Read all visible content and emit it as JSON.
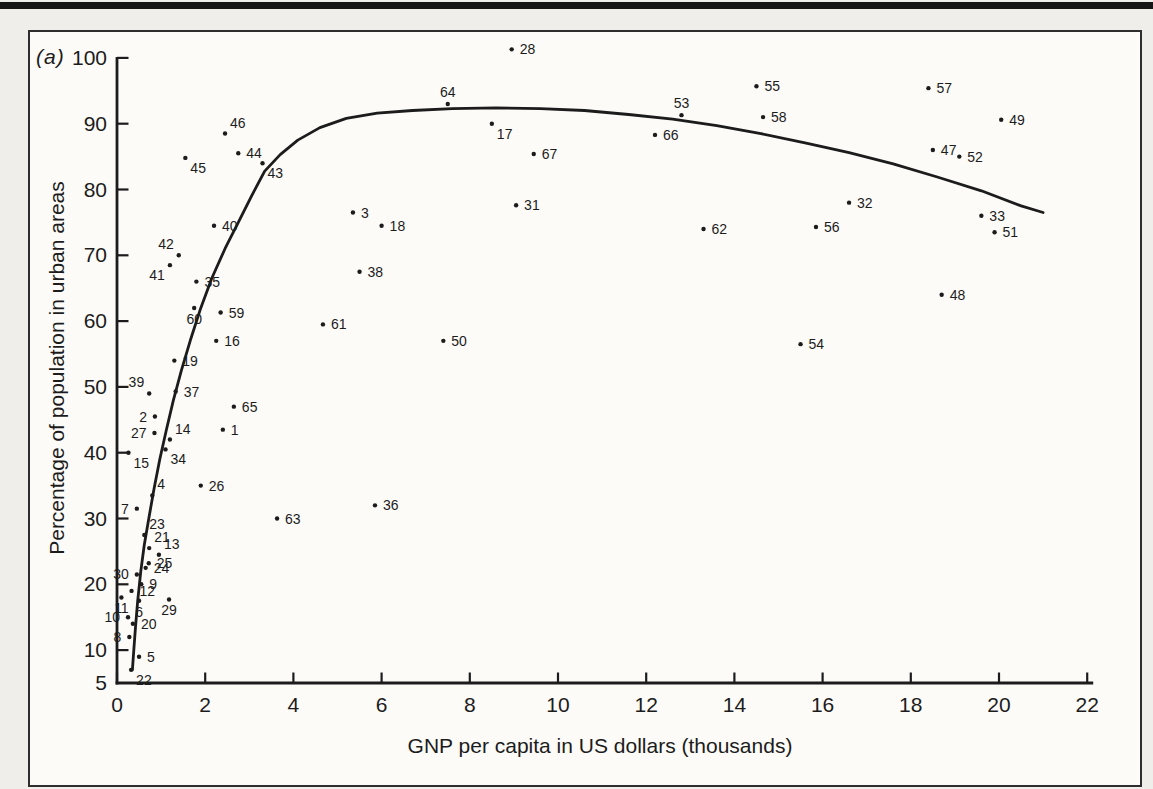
{
  "page": {
    "background_color": "#efeeea",
    "top_rule_color": "#161616"
  },
  "figure": {
    "panel_label": "(a)",
    "border_color": "#2e2e2e",
    "paper_color": "#fcfbf8",
    "ink_color": "#1c1c1c"
  },
  "chart_data": {
    "type": "scatter",
    "title": "",
    "xlabel": "GNP per capita in US dollars (thousands)",
    "ylabel": "Percentage of population in urban areas",
    "xlim": [
      0,
      22
    ],
    "ylim": [
      5,
      100
    ],
    "grid": false,
    "legend": "none",
    "x_ticks": [
      0,
      2,
      4,
      6,
      8,
      10,
      12,
      14,
      16,
      18,
      20,
      22
    ],
    "y_ticks": [
      100,
      90,
      80,
      70,
      60,
      50,
      40,
      30,
      20,
      10
    ],
    "y_axis_end_label": "5",
    "marker": "dot",
    "points": [
      {
        "id": 1,
        "x": 2.4,
        "y": 43.5,
        "label_side": "right"
      },
      {
        "id": 2,
        "x": 0.86,
        "y": 45.5,
        "label_side": "left"
      },
      {
        "id": 3,
        "x": 5.35,
        "y": 76.5,
        "label_side": "right"
      },
      {
        "id": 4,
        "x": 0.8,
        "y": 33.5,
        "label_side": "above-right"
      },
      {
        "id": 5,
        "x": 0.5,
        "y": 9,
        "label_side": "right"
      },
      {
        "id": 6,
        "x": 0.5,
        "y": 17.5,
        "label_side": "below"
      },
      {
        "id": 7,
        "x": 0.45,
        "y": 31.5,
        "label_side": "left"
      },
      {
        "id": 8,
        "x": 0.28,
        "y": 12,
        "label_side": "left"
      },
      {
        "id": 9,
        "x": 0.55,
        "y": 20,
        "label_side": "right"
      },
      {
        "id": 10,
        "x": 0.25,
        "y": 15,
        "label_side": "left"
      },
      {
        "id": 11,
        "x": 0.1,
        "y": 18,
        "label_side": "below"
      },
      {
        "id": 12,
        "x": 0.33,
        "y": 19,
        "label_side": "right"
      },
      {
        "id": 13,
        "x": 0.95,
        "y": 24.5,
        "label_side": "above-right"
      },
      {
        "id": 14,
        "x": 1.2,
        "y": 42,
        "label_side": "above-right"
      },
      {
        "id": 15,
        "x": 0.26,
        "y": 40,
        "label_side": "below-right"
      },
      {
        "id": 16,
        "x": 2.25,
        "y": 57,
        "label_side": "right"
      },
      {
        "id": 17,
        "x": 8.5,
        "y": 90,
        "label_side": "below-right"
      },
      {
        "id": 18,
        "x": 6.0,
        "y": 74.5,
        "label_side": "right"
      },
      {
        "id": 19,
        "x": 1.3,
        "y": 54,
        "label_side": "right"
      },
      {
        "id": 20,
        "x": 0.36,
        "y": 14,
        "label_side": "right"
      },
      {
        "id": 21,
        "x": 0.73,
        "y": 25.5,
        "label_side": "above-right"
      },
      {
        "id": 22,
        "x": 0.32,
        "y": 7,
        "label_side": "below-right"
      },
      {
        "id": 23,
        "x": 0.62,
        "y": 27.5,
        "label_side": "above-right"
      },
      {
        "id": 24,
        "x": 0.65,
        "y": 22.5,
        "label_side": "right"
      },
      {
        "id": 25,
        "x": 0.72,
        "y": 23.2,
        "label_side": "right"
      },
      {
        "id": 26,
        "x": 1.9,
        "y": 35,
        "label_side": "right"
      },
      {
        "id": 27,
        "x": 0.85,
        "y": 43,
        "label_side": "left"
      },
      {
        "id": 28,
        "x": 8.95,
        "y": 101.3,
        "label_side": "right"
      },
      {
        "id": 29,
        "x": 1.18,
        "y": 17.7,
        "label_side": "below"
      },
      {
        "id": 30,
        "x": 0.45,
        "y": 21.5,
        "label_side": "left"
      },
      {
        "id": 31,
        "x": 9.05,
        "y": 77.6,
        "label_side": "right"
      },
      {
        "id": 32,
        "x": 16.6,
        "y": 78,
        "label_side": "right"
      },
      {
        "id": 33,
        "x": 19.6,
        "y": 76,
        "label_side": "right"
      },
      {
        "id": 34,
        "x": 1.1,
        "y": 40.5,
        "label_side": "below-right"
      },
      {
        "id": 35,
        "x": 1.8,
        "y": 66,
        "label_side": "right"
      },
      {
        "id": 36,
        "x": 5.85,
        "y": 32,
        "label_side": "right"
      },
      {
        "id": 37,
        "x": 1.33,
        "y": 49.3,
        "label_side": "right"
      },
      {
        "id": 38,
        "x": 5.5,
        "y": 67.5,
        "label_side": "right"
      },
      {
        "id": 39,
        "x": 0.73,
        "y": 49,
        "label_side": "above-left"
      },
      {
        "id": 40,
        "x": 2.2,
        "y": 74.5,
        "label_side": "right"
      },
      {
        "id": 41,
        "x": 1.2,
        "y": 68.5,
        "label_side": "below-left"
      },
      {
        "id": 42,
        "x": 1.4,
        "y": 70,
        "label_side": "above-left"
      },
      {
        "id": 43,
        "x": 3.3,
        "y": 84,
        "label_side": "below-right"
      },
      {
        "id": 44,
        "x": 2.75,
        "y": 85.5,
        "label_side": "right"
      },
      {
        "id": 45,
        "x": 1.55,
        "y": 84.8,
        "label_side": "below-right"
      },
      {
        "id": 46,
        "x": 2.45,
        "y": 88.5,
        "label_side": "above-right"
      },
      {
        "id": 47,
        "x": 18.5,
        "y": 86,
        "label_side": "right"
      },
      {
        "id": 48,
        "x": 18.7,
        "y": 64,
        "label_side": "right"
      },
      {
        "id": 49,
        "x": 20.05,
        "y": 90.6,
        "label_side": "right"
      },
      {
        "id": 50,
        "x": 7.4,
        "y": 57,
        "label_side": "right"
      },
      {
        "id": 51,
        "x": 19.9,
        "y": 73.5,
        "label_side": "right"
      },
      {
        "id": 52,
        "x": 19.1,
        "y": 85,
        "label_side": "right"
      },
      {
        "id": 53,
        "x": 12.8,
        "y": 91.3,
        "label_side": "above"
      },
      {
        "id": 54,
        "x": 15.5,
        "y": 56.5,
        "label_side": "right"
      },
      {
        "id": 55,
        "x": 14.5,
        "y": 95.7,
        "label_side": "right"
      },
      {
        "id": 56,
        "x": 15.85,
        "y": 74.3,
        "label_side": "right"
      },
      {
        "id": 57,
        "x": 18.4,
        "y": 95.4,
        "label_side": "right"
      },
      {
        "id": 58,
        "x": 14.65,
        "y": 91,
        "label_side": "right"
      },
      {
        "id": 59,
        "x": 2.35,
        "y": 61.3,
        "label_side": "right"
      },
      {
        "id": 60,
        "x": 1.75,
        "y": 62,
        "label_side": "below"
      },
      {
        "id": 61,
        "x": 4.67,
        "y": 59.5,
        "label_side": "right"
      },
      {
        "id": 62,
        "x": 13.3,
        "y": 74,
        "label_side": "right"
      },
      {
        "id": 63,
        "x": 3.63,
        "y": 30,
        "label_side": "right"
      },
      {
        "id": 64,
        "x": 7.5,
        "y": 93,
        "label_side": "above"
      },
      {
        "id": 65,
        "x": 2.65,
        "y": 47,
        "label_side": "right"
      },
      {
        "id": 66,
        "x": 12.2,
        "y": 88.3,
        "label_side": "right"
      },
      {
        "id": 67,
        "x": 9.45,
        "y": 85.4,
        "label_side": "right"
      }
    ],
    "fitted_curve": [
      [
        0.35,
        7
      ],
      [
        0.38,
        10
      ],
      [
        0.42,
        13.5
      ],
      [
        0.47,
        17.5
      ],
      [
        0.54,
        22
      ],
      [
        0.62,
        26
      ],
      [
        0.72,
        30
      ],
      [
        0.84,
        34.5
      ],
      [
        0.97,
        39
      ],
      [
        1.12,
        43.5
      ],
      [
        1.28,
        48
      ],
      [
        1.46,
        52.5
      ],
      [
        1.66,
        57
      ],
      [
        1.9,
        62
      ],
      [
        2.15,
        66.5
      ],
      [
        2.45,
        71
      ],
      [
        2.75,
        75
      ],
      [
        3.05,
        79
      ],
      [
        3.35,
        82.8
      ],
      [
        3.7,
        85.3
      ],
      [
        4.1,
        87.5
      ],
      [
        4.6,
        89.4
      ],
      [
        5.2,
        90.8
      ],
      [
        5.9,
        91.6
      ],
      [
        6.7,
        92.0
      ],
      [
        7.6,
        92.3
      ],
      [
        8.6,
        92.4
      ],
      [
        9.6,
        92.3
      ],
      [
        10.6,
        92.0
      ],
      [
        11.6,
        91.4
      ],
      [
        12.6,
        90.7
      ],
      [
        13.6,
        89.7
      ],
      [
        14.6,
        88.5
      ],
      [
        15.6,
        87.1
      ],
      [
        16.6,
        85.6
      ],
      [
        17.6,
        83.9
      ],
      [
        18.6,
        81.9
      ],
      [
        19.6,
        79.8
      ],
      [
        20.5,
        77.5
      ],
      [
        21.0,
        76.5
      ]
    ]
  }
}
